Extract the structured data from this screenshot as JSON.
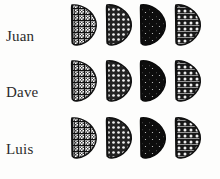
{
  "figure": {
    "background_color": "#fdfdfc",
    "ink_color": "#1a1a1a",
    "label_color": "#2b2b2b",
    "rows": 3,
    "columns": 4
  },
  "rows": [
    {
      "label": "Juan",
      "specimens": [
        {
          "column": 1,
          "shade": "light",
          "pattern": "fine-checker",
          "fill_hex": "#4a4a4a",
          "density_pct": 45
        },
        {
          "column": 2,
          "shade": "medium",
          "pattern": "coarse-dots",
          "fill_hex": "#2e2e2e",
          "density_pct": 65
        },
        {
          "column": 3,
          "shade": "dark",
          "pattern": "solid-speckle",
          "fill_hex": "#101010",
          "density_pct": 92
        },
        {
          "column": 4,
          "shade": "medium-dark",
          "pattern": "grid-dots",
          "fill_hex": "#1f1f1f",
          "density_pct": 78
        }
      ]
    },
    {
      "label": "Dave",
      "specimens": [
        {
          "column": 1,
          "shade": "light",
          "pattern": "fine-checker",
          "fill_hex": "#4a4a4a",
          "density_pct": 45
        },
        {
          "column": 2,
          "shade": "medium",
          "pattern": "coarse-dots",
          "fill_hex": "#2e2e2e",
          "density_pct": 65
        },
        {
          "column": 3,
          "shade": "dark",
          "pattern": "solid-speckle",
          "fill_hex": "#101010",
          "density_pct": 92
        },
        {
          "column": 4,
          "shade": "medium-dark",
          "pattern": "grid-dots",
          "fill_hex": "#1f1f1f",
          "density_pct": 78
        }
      ]
    },
    {
      "label": "Luis",
      "specimens": [
        {
          "column": 1,
          "shade": "light",
          "pattern": "fine-checker",
          "fill_hex": "#4a4a4a",
          "density_pct": 45
        },
        {
          "column": 2,
          "shade": "medium",
          "pattern": "coarse-dots",
          "fill_hex": "#2e2e2e",
          "density_pct": 65
        },
        {
          "column": 3,
          "shade": "dark",
          "pattern": "solid-speckle",
          "fill_hex": "#101010",
          "density_pct": 92
        },
        {
          "column": 4,
          "shade": "medium-dark",
          "pattern": "grid-dots",
          "fill_hex": "#1f1f1f",
          "density_pct": 78
        }
      ]
    }
  ]
}
